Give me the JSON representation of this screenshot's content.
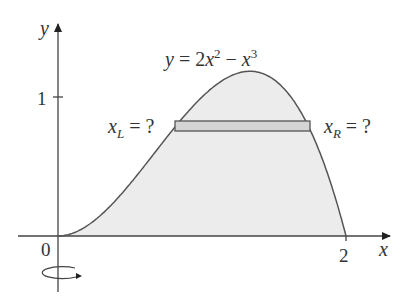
{
  "diagram": {
    "equation": {
      "lhs": "y",
      "eq": " = 2",
      "x1": "x",
      "exp1": "2",
      "minus": " − ",
      "x2": "x",
      "exp2": "3"
    },
    "axes": {
      "x_label": "x",
      "y_label": "y",
      "origin_label": "0",
      "x_tick_label": "2",
      "y_tick_label": "1"
    },
    "left_label": {
      "var": "x",
      "sub": "L",
      "rest": " = ?"
    },
    "right_label": {
      "var": "x",
      "sub": "R",
      "rest": " = ?"
    },
    "rotation_icon": "rotation-arrow-icon",
    "colors": {
      "fill": "#ececec",
      "strip": "#d4d4d4",
      "stroke": "#444444"
    }
  }
}
